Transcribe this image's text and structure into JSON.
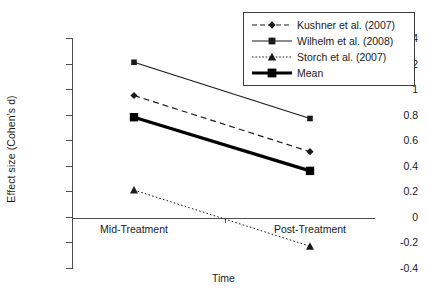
{
  "chart_data": {
    "type": "line",
    "title": "",
    "xlabel": "Time",
    "ylabel": "Effect size (Cohen's d)",
    "categories": [
      "Mid-Treatment",
      "Post-Treatment"
    ],
    "ylim": [
      -0.4,
      1.4
    ],
    "ytick_labels": [
      "1.4",
      "1.2",
      "1",
      "0.8",
      "0.6",
      "0.4",
      "0.2",
      "0",
      "-0.2",
      "-0.4"
    ],
    "ytick_values": [
      1.4,
      1.2,
      1.0,
      0.8,
      0.6,
      0.4,
      0.2,
      0.0,
      -0.2,
      -0.4
    ],
    "grid": false,
    "legend_position": "top-right",
    "series": [
      {
        "name": "Kushner et al. (2007)",
        "values": [
          0.95,
          0.51
        ],
        "line_style": "dashed",
        "marker": "diamond",
        "line_width": 1.2,
        "color": "#1a1a1a"
      },
      {
        "name": "Wilhelm et al. (2008)",
        "values": [
          1.21,
          0.77
        ],
        "line_style": "solid",
        "marker": "square",
        "line_width": 1.2,
        "color": "#1a1a1a"
      },
      {
        "name": "Storch et al. (2007)",
        "values": [
          0.21,
          -0.23
        ],
        "line_style": "dotted",
        "marker": "triangle",
        "line_width": 1.0,
        "color": "#1a1a1a"
      },
      {
        "name": "Mean",
        "values": [
          0.78,
          0.36
        ],
        "line_style": "solid",
        "marker": "square",
        "line_width": 3.2,
        "color": "#000000"
      }
    ]
  },
  "legend": {
    "entries": [
      "Kushner et al. (2007)",
      "Wilhelm et al. (2008)",
      "Storch et al. (2007)",
      "Mean"
    ]
  },
  "colors": {
    "axis": "#4d4d4d",
    "text": "#1a1a1a",
    "data": "#1a1a1a",
    "mean": "#000000",
    "background": "#ffffff"
  }
}
